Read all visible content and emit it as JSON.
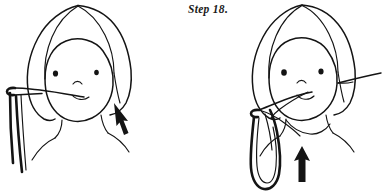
{
  "page": {
    "kind": "hand-drawn instructional illustration",
    "background_color": "#ffffff",
    "ink_color": "#141414",
    "width": 382,
    "height": 195
  },
  "caption": {
    "step_label": "Step 18."
  },
  "figures": [
    {
      "id": "left-figure",
      "name": "head-with-cord-in-mouth-before",
      "description": "Front view of a head with shoulder-length parted hair, two dot eyes, small arc nose and a slightly smiling mouth. A cord enters the mouth and runs left, looping over itself and hanging down past the left shoulder.",
      "arrow": {
        "name": "pull-arrow-down-right",
        "direction": "down-left-to-up-left",
        "points_toward": "mouth"
      },
      "facial_features": {
        "eyes": 2,
        "nose": "small-arc",
        "mouth": "slight-smile"
      },
      "cord": {
        "name": "hanging-cord",
        "ends": "knot-loop-at-upper-left",
        "path": "from mouth out to the left, over a small loop, then two strands hang down"
      }
    },
    {
      "id": "right-figure",
      "name": "head-with-cord-in-mouth-after",
      "description": "Same head, now the cord has been drawn out of the mouth forming a long narrow hanging loop in front of the chest. A short straight cord end extends off to the right of the head.",
      "arrow": {
        "name": "pull-arrow-up",
        "direction": "up",
        "points_toward": "loop"
      },
      "facial_features": {
        "eyes": 2,
        "nose": "small-arc",
        "mouth": "slight-smile"
      },
      "cord": {
        "name": "drawn-loop-cord",
        "ends": "small-knot-loop-left-of-chin",
        "path": "from mouth down-left through a small knot, then a long U shaped loop hanging to the lower edge"
      },
      "cord_tail": {
        "name": "cord-tail-right",
        "path": "short straight line from right cheek out to the right image edge"
      }
    }
  ]
}
